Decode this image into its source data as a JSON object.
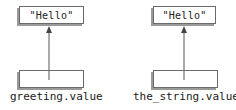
{
  "diagram": {
    "left": {
      "object_text": "\"Hello\"",
      "variable_label": "greeting.value"
    },
    "right": {
      "object_text": "\"Hello\"",
      "variable_label": "the_string.value"
    }
  },
  "colors": {
    "border": "#6a6a6a",
    "shadow": "#9a9a9a",
    "arrow": "#555555",
    "text": "#1a1a1a"
  }
}
